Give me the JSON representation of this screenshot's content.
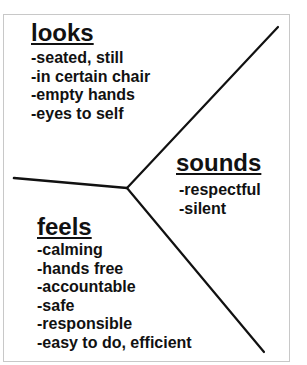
{
  "diagram": {
    "type": "y-chart",
    "sections": [
      {
        "id": "looks",
        "heading": "looks",
        "items": [
          "-seated, still",
          "-in certain chair",
          "-empty hands",
          "-eyes to self"
        ]
      },
      {
        "id": "sounds",
        "heading": "sounds",
        "items": [
          "-respectful",
          "-silent"
        ]
      },
      {
        "id": "feels",
        "heading": "feels",
        "items": [
          "-calming",
          "-hands free",
          "-accountable",
          "-safe",
          "-responsible",
          "-easy to do, efficient"
        ]
      }
    ],
    "colors": {
      "line": "#111111",
      "frame": "#c8c8c8",
      "background": "#ffffff"
    }
  }
}
